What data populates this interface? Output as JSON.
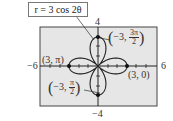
{
  "chart_data": {
    "type": "line",
    "title": "r = 3 cos 2θ",
    "equation": "r = 3 cos 2θ",
    "curve": "four-petaled rose",
    "xlim": [
      -6,
      6
    ],
    "ylim": [
      -4,
      4
    ],
    "tick_labels": {
      "x_min": "−6",
      "x_max": "6",
      "y_min": "−4",
      "y_max": "4"
    },
    "grid": false,
    "background": "#e6e6e6",
    "points": [
      {
        "label": "(3, 0)",
        "polar": [
          3,
          "0"
        ],
        "xy": [
          3,
          0
        ]
      },
      {
        "label": "(3, π)",
        "polar": [
          3,
          "π"
        ],
        "xy": [
          -3,
          0
        ]
      },
      {
        "label": "(−3, 3π/2)",
        "polar": [
          -3,
          "3π/2"
        ],
        "xy": [
          0,
          3
        ]
      },
      {
        "label": "(−3, π/2)",
        "polar": [
          -3,
          "π/2"
        ],
        "xy": [
          0,
          -3
        ]
      }
    ]
  },
  "labels": {
    "equation": "r = 3 cos 2θ",
    "y_max": "4",
    "y_min": "−4",
    "x_min": "−6",
    "x_max": "6",
    "pt_right": "(3, 0)",
    "pt_left": "(3, π)",
    "pt_top_prefix": "−3, ",
    "pt_top_num": "3π",
    "pt_top_den": "2",
    "pt_bottom_prefix": "−3, ",
    "pt_bottom_num": "π",
    "pt_bottom_den": "2",
    "lparen": "(",
    "rparen": ")"
  }
}
